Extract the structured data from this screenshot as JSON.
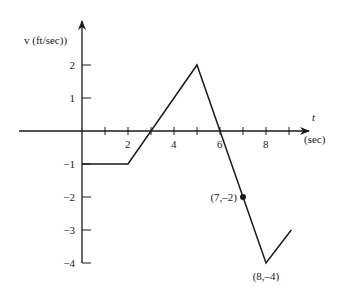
{
  "chart_data": {
    "type": "line",
    "title": "",
    "xlabel": "t",
    "xlabel_unit": "(sec)",
    "ylabel": "v (ft/sec))",
    "xlim": [
      -2.7,
      9.8
    ],
    "ylim": [
      -4,
      3.3
    ],
    "x_ticks": [
      1,
      2,
      3,
      4,
      5,
      6,
      7,
      8,
      9
    ],
    "x_tick_labels": [
      {
        "value": 2,
        "label": "2"
      },
      {
        "value": 4,
        "label": "4"
      },
      {
        "value": 6,
        "label": "6"
      },
      {
        "value": 8,
        "label": "8"
      }
    ],
    "y_ticks": [
      2,
      1,
      -1,
      -2,
      -3,
      -4
    ],
    "y_tick_labels": [
      {
        "value": 2,
        "label": "2"
      },
      {
        "value": 1,
        "label": "1"
      },
      {
        "value": -1,
        "label": "−1"
      },
      {
        "value": -2,
        "label": "−2"
      },
      {
        "value": -3,
        "label": "−3"
      },
      {
        "value": -4,
        "label": "−4"
      }
    ],
    "grid": false,
    "legend": null,
    "series": [
      {
        "name": "v(t)",
        "color": "#1a1a1a",
        "points": [
          {
            "x": 0,
            "y": -1
          },
          {
            "x": 2,
            "y": -1
          },
          {
            "x": 5,
            "y": 2
          },
          {
            "x": 8,
            "y": -4
          },
          {
            "x": 9.1,
            "y": -3
          }
        ]
      }
    ],
    "annotations": [
      {
        "x": 7,
        "y": -2,
        "label": "(7,–2)",
        "marker": "dot"
      },
      {
        "x": 8,
        "y": -4,
        "label": "(8,–4)",
        "marker": "none"
      }
    ]
  }
}
